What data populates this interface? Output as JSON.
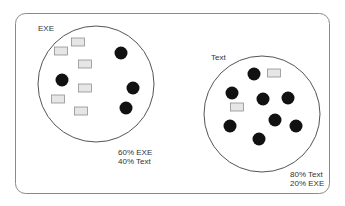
{
  "colors": {
    "frame": "#8a8a8a",
    "circle": "#555555",
    "dot": "#111111",
    "rect_fill": "#e6e6e6",
    "rect_stroke": "#8f8f8f",
    "text": "#333333"
  },
  "groups": [
    {
      "id": "exe",
      "title": "EXE",
      "circle": {
        "cx": 96,
        "cy": 84,
        "r": 58
      },
      "title_pos": {
        "x": 38,
        "y": 31
      },
      "stats": [
        "60% EXE",
        "40% Text"
      ],
      "stats_pos": {
        "x": 118,
        "y": 155
      },
      "rects": [
        {
          "x": 61,
          "y": 51
        },
        {
          "x": 78,
          "y": 42
        },
        {
          "x": 85,
          "y": 64
        },
        {
          "x": 85,
          "y": 88
        },
        {
          "x": 58,
          "y": 99
        },
        {
          "x": 81,
          "y": 111
        }
      ],
      "dots": [
        {
          "x": 121,
          "y": 53
        },
        {
          "x": 62,
          "y": 80
        },
        {
          "x": 133,
          "y": 88
        },
        {
          "x": 126,
          "y": 108
        }
      ]
    },
    {
      "id": "text",
      "title": "Text",
      "circle": {
        "cx": 262,
        "cy": 114,
        "r": 58
      },
      "title_pos": {
        "x": 211,
        "y": 60
      },
      "stats": [
        "80% Text",
        "20% EXE"
      ],
      "stats_pos": {
        "x": 290,
        "y": 177
      },
      "rects": [
        {
          "x": 274,
          "y": 73
        },
        {
          "x": 237,
          "y": 107
        }
      ],
      "dots": [
        {
          "x": 254,
          "y": 74
        },
        {
          "x": 232,
          "y": 93
        },
        {
          "x": 263,
          "y": 99
        },
        {
          "x": 288,
          "y": 98
        },
        {
          "x": 275,
          "y": 120
        },
        {
          "x": 230,
          "y": 126
        },
        {
          "x": 296,
          "y": 126
        },
        {
          "x": 259,
          "y": 139
        }
      ]
    }
  ]
}
